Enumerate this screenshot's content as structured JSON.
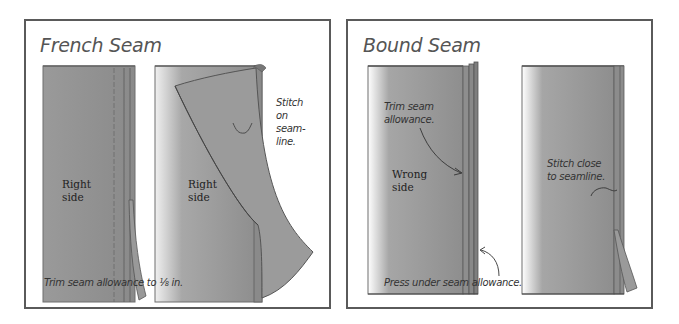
{
  "figures": [
    {
      "title": "French Seam",
      "panels": [
        {
          "fabric_label": "Right\nside",
          "fabric_label_lines": [
            "Right",
            "side"
          ]
        },
        {
          "fabric_label_lines": [
            "Right",
            "side"
          ],
          "callout_lines": [
            "Stitch",
            "on",
            "seam-",
            "line."
          ]
        }
      ],
      "caption": "Trim seam allowance to ⅛ in."
    },
    {
      "title": "Bound Seam",
      "panels": [
        {
          "fabric_label_lines": [
            "Wrong",
            "side"
          ],
          "callout_lines": [
            "Trim seam",
            "allowance."
          ]
        },
        {
          "callout_lines": [
            "Stitch close",
            "to seamline."
          ]
        }
      ],
      "caption": "Press under seam allowance."
    }
  ],
  "colors": {
    "frame": "#5a5a5a",
    "fabric_dark": "#8a8a8a",
    "fabric_light": "#f2f2f2",
    "seam_edge": "#6e6e6e",
    "text": "#333333"
  }
}
